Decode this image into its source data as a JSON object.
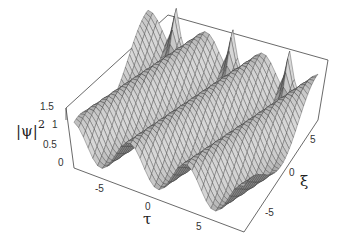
{
  "chart_data": {
    "type": "surface3d",
    "title": "",
    "xlabel": "τ",
    "ylabel": "ξ",
    "zlabel": "|ψ|²",
    "zlabel_base": "|ψ|",
    "zlabel_exp": "2",
    "xlim": [
      -9,
      9
    ],
    "ylim": [
      -9,
      9
    ],
    "zlim": [
      0,
      1.5
    ],
    "x_ticks": [
      "-5",
      "0",
      "5"
    ],
    "y_ticks": [
      "-5",
      "0",
      "5"
    ],
    "z_ticks": [
      "0",
      "0.5",
      "1",
      "1.5"
    ],
    "peaks": [
      {
        "tau": -6,
        "xi": 9,
        "height": 1.9
      },
      {
        "tau": 0,
        "xi": 9,
        "height": 1.8
      },
      {
        "tau": 6,
        "xi": 9,
        "height": 1.7
      }
    ],
    "surface_color": "#a8a8a8",
    "mesh_color": "#333333",
    "box_color": "#444444",
    "grid": false,
    "box": true
  }
}
